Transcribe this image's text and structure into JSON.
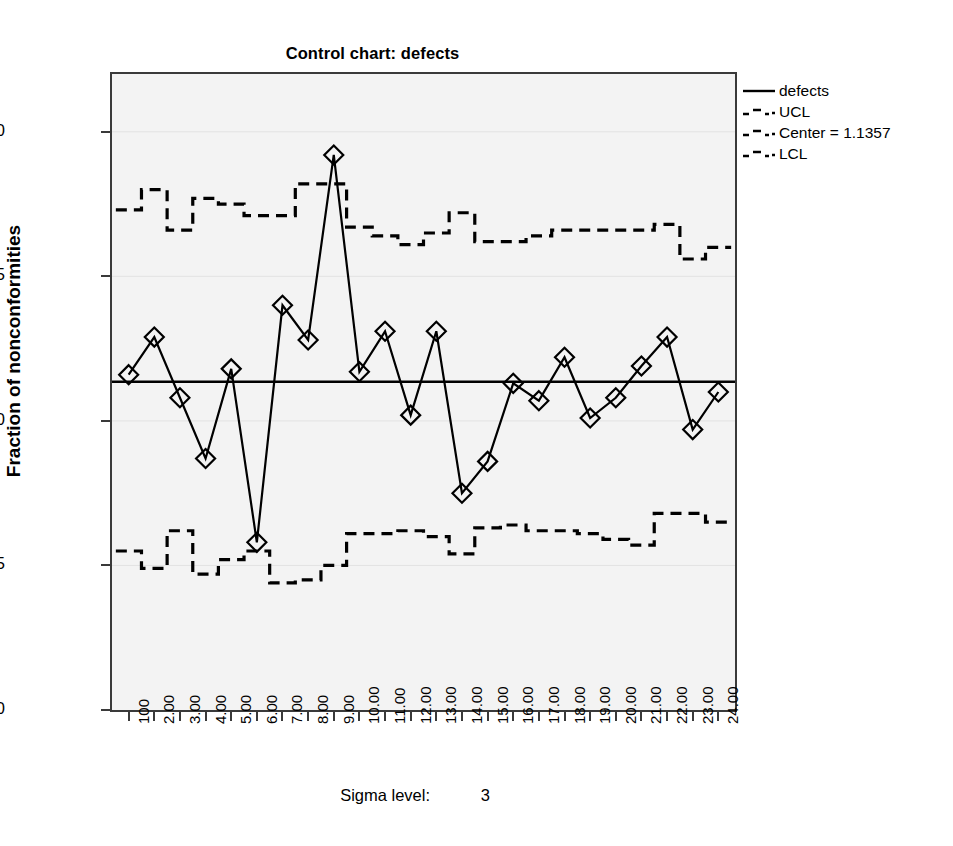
{
  "title": "Control chart: defects",
  "y_axis_title": "Fraction of nonconformities",
  "footer": {
    "label": "Sigma level:",
    "value": "3"
  },
  "legend": {
    "position": "right",
    "items": [
      {
        "label": "defects",
        "style": "solid",
        "icon": "solid-line-icon"
      },
      {
        "label": "UCL",
        "style": "dashed",
        "icon": "dashed-line-icon"
      },
      {
        "label": "Center = 1.1357",
        "style": "dashed",
        "icon": "dashed-line-icon"
      },
      {
        "label": "LCL",
        "style": "dashed",
        "icon": "dashed-line-icon"
      }
    ]
  },
  "colors": {
    "series": "#000000",
    "plot_background": "#f3f3f3",
    "frame": "#3a3a3a",
    "gridline": "#e2e2e2"
  },
  "chart_data": {
    "type": "line",
    "title": "Control chart: defects",
    "xlabel": "",
    "ylabel": "Fraction of nonconformities",
    "xlim": [
      0.35,
      24.65
    ],
    "ylim": [
      0.0,
      2.2
    ],
    "ytick_labels": [
      "0.0",
      "0.5",
      "1.0",
      "1.5",
      "2.0"
    ],
    "yticks": [
      0.0,
      0.5,
      1.0,
      1.5,
      2.0
    ],
    "xtick_labels": [
      "100",
      "2.00",
      "3.00",
      "4.00",
      "5.00",
      "6.00",
      "7.00",
      "8.00",
      "9.00",
      "10.00",
      "11.00",
      "12.00",
      "13.00",
      "14.00",
      "15.00",
      "16.00",
      "17.00",
      "18.00",
      "19.00",
      "20.00",
      "21.00",
      "22.00",
      "23.00",
      "24.00"
    ],
    "x": [
      1,
      2,
      3,
      4,
      5,
      6,
      7,
      8,
      9,
      10,
      11,
      12,
      13,
      14,
      15,
      16,
      17,
      18,
      19,
      20,
      21,
      22,
      23,
      24
    ],
    "grid": "horizontal-faint",
    "center_line": 1.1357,
    "sigma_level": 3,
    "series": [
      {
        "name": "defects",
        "style": "solid",
        "marker": "diamond",
        "values": [
          1.16,
          1.29,
          1.08,
          0.87,
          1.18,
          0.58,
          1.4,
          1.28,
          1.92,
          1.17,
          1.31,
          1.02,
          1.31,
          0.75,
          0.86,
          1.13,
          1.07,
          1.22,
          1.01,
          1.08,
          1.19,
          1.29,
          0.97,
          1.1
        ]
      },
      {
        "name": "UCL",
        "style": "dashed",
        "marker": "none",
        "values": [
          1.73,
          1.8,
          1.66,
          1.77,
          1.75,
          1.71,
          1.71,
          1.82,
          1.82,
          1.67,
          1.64,
          1.61,
          1.65,
          1.72,
          1.62,
          1.62,
          1.64,
          1.66,
          1.66,
          1.66,
          1.66,
          1.68,
          1.56,
          1.6
        ]
      },
      {
        "name": "Center",
        "style": "solid",
        "marker": "none",
        "values": [
          1.1357,
          1.1357,
          1.1357,
          1.1357,
          1.1357,
          1.1357,
          1.1357,
          1.1357,
          1.1357,
          1.1357,
          1.1357,
          1.1357,
          1.1357,
          1.1357,
          1.1357,
          1.1357,
          1.1357,
          1.1357,
          1.1357,
          1.1357,
          1.1357,
          1.1357,
          1.1357,
          1.1357
        ]
      },
      {
        "name": "LCL",
        "style": "dashed",
        "marker": "none",
        "values": [
          0.55,
          0.49,
          0.62,
          0.47,
          0.52,
          0.55,
          0.44,
          0.45,
          0.5,
          0.61,
          0.61,
          0.62,
          0.6,
          0.54,
          0.63,
          0.64,
          0.62,
          0.62,
          0.61,
          0.59,
          0.57,
          0.68,
          0.68,
          0.65
        ]
      }
    ]
  }
}
